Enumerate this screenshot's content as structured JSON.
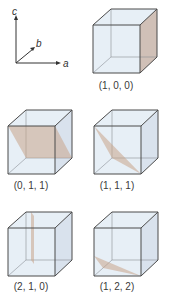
{
  "axes": {
    "a": "a",
    "b": "b",
    "c": "c"
  },
  "colors": {
    "plane": "#c9a48a",
    "cube_face": "#dfeaf3",
    "edge": "#4a4a4a"
  },
  "cubes": [
    {
      "label": "(1, 0, 0)"
    },
    {
      "label": "(0, 1, 1)"
    },
    {
      "label": "(1, 1, 1)"
    },
    {
      "label": "(2, 1, 0)"
    },
    {
      "label": "(1, 2, 2)"
    }
  ]
}
